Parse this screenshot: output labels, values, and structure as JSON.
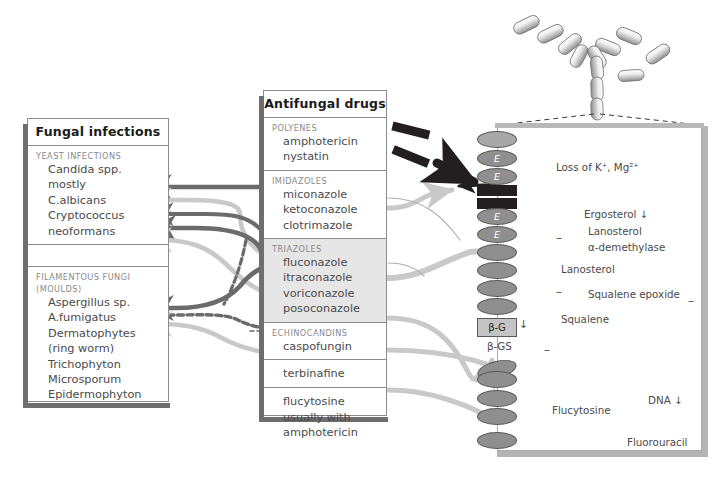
{
  "infections_panel": {
    "title": "Fungal infections",
    "sections": [
      {
        "caption": "YEAST INFECTIONS",
        "items": [
          "Candida spp.",
          "mostly",
          "C.albicans",
          "Cryptococcus",
          "neoformans"
        ]
      },
      {
        "caption": "",
        "items": []
      },
      {
        "caption": "FILAMENTOUS FUNGI\n(MOULDS)",
        "caption_line1": "FILAMENTOUS FUNGI",
        "caption_line2": "(MOULDS)",
        "items": [
          "Aspergillus sp.",
          "A.fumigatus",
          "Dermatophytes",
          "(ring worm)",
          "Trichophyton",
          "Microsporum",
          "Epidermophyton"
        ]
      }
    ]
  },
  "drugs_panel": {
    "title": "Antifungal drugs",
    "sections": [
      {
        "caption": "POLYENES",
        "items": [
          "amphotericin",
          "nystatin"
        ],
        "shaded": false
      },
      {
        "caption": "IMIDAZOLES",
        "items": [
          "miconazole",
          "ketoconazole",
          "clotrimazole"
        ],
        "shaded": false
      },
      {
        "caption": "TRIAZOLES",
        "items": [
          "fluconazole",
          "itraconazole",
          "voriconazole",
          "posoconazole"
        ],
        "shaded": true
      },
      {
        "caption": "ECHINOCANDINS",
        "items": [
          "caspofungin"
        ],
        "shaded": false
      },
      {
        "caption": "",
        "items": [
          "terbinafine"
        ],
        "shaded": false
      },
      {
        "caption": "",
        "items": [
          "flucytosine",
          "usually with",
          "amphotericin"
        ],
        "shaded": false
      }
    ]
  },
  "cell": {
    "membrane_marker": "E",
    "glucan_box": "β-G",
    "glucan_synthase": "β-GS",
    "labels": {
      "loss_ions": "Loss of K⁺, Mg²⁺",
      "ergosterol": "Ergosterol ↓",
      "lanosterol_demethylase_l1": "Lanosterol",
      "lanosterol_demethylase_l2": "α-demethylase",
      "lanosterol": "Lanosterol",
      "squalene_epoxide": "Squalene epoxide",
      "squalene": "Squalene",
      "flucytosine": "Flucytosine",
      "fluorouracil": "Fluorouracil",
      "dna": "DNA ↓"
    },
    "inhibition_signs": [
      "–",
      "–",
      "–",
      "–"
    ]
  },
  "colors": {
    "dark_arrow": "#6b6b6b",
    "light_arrow": "#c9c9c9",
    "mid_arrow": "#9a9a9a",
    "black": "#231f20",
    "membrane": "#8f8f8f",
    "shade": "#e6e6e6",
    "panel_border": "#8c8c8c",
    "cell_border": "#b4b4b4"
  }
}
